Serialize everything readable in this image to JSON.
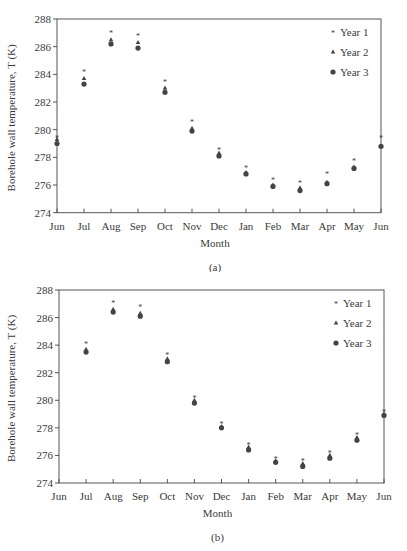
{
  "chart_data": [
    {
      "id": "a",
      "type": "scatter",
      "caption": "(a)",
      "title": "",
      "xlabel": "Month",
      "ylabel": "Borehole wall temperature, T (K)",
      "ylim": [
        274,
        288
      ],
      "yticks": [
        274,
        276,
        278,
        280,
        282,
        284,
        286,
        288
      ],
      "categories": [
        "Jun",
        "Jul",
        "Aug",
        "Sep",
        "Oct",
        "Nov",
        "Dec",
        "Jan",
        "Feb",
        "Mar",
        "Apr",
        "May",
        "Jun"
      ],
      "grid": false,
      "legend_position": "upper right",
      "series": [
        {
          "name": "Year 1",
          "marker": "star",
          "values": [
            279.4,
            284.2,
            287.0,
            286.8,
            283.5,
            280.6,
            278.6,
            277.3,
            276.4,
            276.2,
            276.8,
            277.8,
            279.4
          ]
        },
        {
          "name": "Year 2",
          "marker": "triangle",
          "values": [
            279.3,
            283.7,
            286.5,
            286.3,
            283.0,
            280.1,
            278.3,
            276.9,
            276.0,
            275.8,
            276.2,
            277.3,
            278.8
          ]
        },
        {
          "name": "Year 3",
          "marker": "circle",
          "values": [
            279.0,
            283.3,
            286.2,
            285.9,
            282.7,
            279.9,
            278.1,
            276.8,
            275.9,
            275.6,
            276.1,
            277.2,
            278.8
          ]
        }
      ]
    },
    {
      "id": "b",
      "type": "scatter",
      "caption": "(b)",
      "title": "",
      "xlabel": "Month",
      "ylabel": "Borehole wall temperature, T (K)",
      "ylim": [
        274,
        288
      ],
      "yticks": [
        274,
        276,
        278,
        280,
        282,
        284,
        286,
        288
      ],
      "categories": [
        "Jun",
        "Jul",
        "Aug",
        "Sep",
        "Oct",
        "Nov",
        "Dec",
        "Jan",
        "Feb",
        "Mar",
        "Apr",
        "May",
        "Jun"
      ],
      "grid": false,
      "legend_position": "upper right",
      "series": [
        {
          "name": "Year 1",
          "marker": "star",
          "values": [
            null,
            284.1,
            287.1,
            286.8,
            283.3,
            280.2,
            278.3,
            276.8,
            275.8,
            275.6,
            276.2,
            277.5,
            279.2
          ]
        },
        {
          "name": "Year 2",
          "marker": "triangle",
          "values": [
            null,
            283.7,
            286.6,
            286.3,
            283.0,
            280.0,
            278.1,
            276.6,
            275.6,
            275.4,
            276.0,
            277.3,
            279.0
          ]
        },
        {
          "name": "Year 3",
          "marker": "circle",
          "values": [
            null,
            283.5,
            286.4,
            286.1,
            282.8,
            279.8,
            278.0,
            276.4,
            275.5,
            275.2,
            275.8,
            277.1,
            278.9
          ]
        }
      ]
    }
  ],
  "style": {
    "axis_color": "#555555",
    "marker_color": "#444444",
    "text_color": "#3a3a3a"
  }
}
